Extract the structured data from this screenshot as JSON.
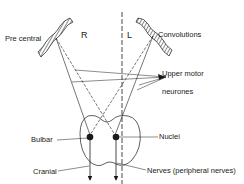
{
  "labels": {
    "pre_central": "Pre central",
    "right": "R",
    "left": "L",
    "convolutions": "Convolutions",
    "upper_motor_1": "Upper motor",
    "upper_motor_2": "neurones",
    "bulbar": "Bulbar",
    "nuclei": "Nuclei",
    "cranial": "Cranial",
    "nerves": "Nerves (peripheral nerves)"
  },
  "colors": {
    "ink": "#1a1a1a",
    "background": "#ffffff"
  }
}
